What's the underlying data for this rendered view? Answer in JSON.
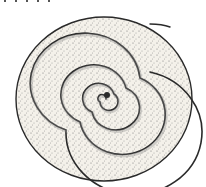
{
  "image": {
    "subject": "coiled sausage spiral",
    "style": "pen-and-ink engraving illustration",
    "colors": {
      "ink": "#2a2a2a",
      "fill": "#f4f1ea",
      "shade": "#8a8a8a",
      "background": "#ffffff"
    },
    "spiral_turns": 6
  }
}
